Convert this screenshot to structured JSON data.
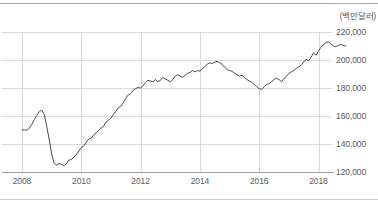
{
  "unit_label": "(백만달러)",
  "axis": {
    "y_ticks": [
      "220,000",
      "200,000",
      "180,000",
      "160,000",
      "140,000",
      "120,000"
    ],
    "x_ticks": [
      "2008",
      "2010",
      "2012",
      "2014",
      "2016",
      "2018"
    ]
  },
  "colors": {
    "line": "#4a4a4a",
    "grid": "#d6d8da",
    "axis": "#9a9da1",
    "text": "#58595b",
    "rule": "#a8abaf"
  },
  "chart_data": {
    "type": "line",
    "title": "",
    "subtitle": "",
    "xlabel": "",
    "ylabel": "(백만달러)",
    "unit": "백만달러",
    "xlim": [
      2008.0,
      2019.0
    ],
    "ylim": [
      120000,
      220000
    ],
    "y_tick_values": [
      220000,
      200000,
      180000,
      160000,
      140000,
      120000
    ],
    "x_tick_values": [
      2008,
      2010,
      2012,
      2014,
      2016,
      2018
    ],
    "grid": true,
    "legend": null,
    "series": [
      {
        "name": "수출액",
        "x": [
          2008.0,
          2008.08,
          2008.17,
          2008.25,
          2008.33,
          2008.42,
          2008.5,
          2008.58,
          2008.67,
          2008.75,
          2008.83,
          2008.92,
          2009.0,
          2009.08,
          2009.17,
          2009.25,
          2009.33,
          2009.42,
          2009.5,
          2009.58,
          2009.67,
          2009.75,
          2009.83,
          2009.92,
          2010.0,
          2010.08,
          2010.17,
          2010.25,
          2010.33,
          2010.42,
          2010.5,
          2010.58,
          2010.67,
          2010.75,
          2010.83,
          2010.92,
          2011.0,
          2011.08,
          2011.17,
          2011.25,
          2011.33,
          2011.42,
          2011.5,
          2011.58,
          2011.67,
          2011.75,
          2011.83,
          2011.92,
          2012.0,
          2012.08,
          2012.17,
          2012.25,
          2012.33,
          2012.42,
          2012.5,
          2012.58,
          2012.67,
          2012.75,
          2012.83,
          2012.92,
          2013.0,
          2013.08,
          2013.17,
          2013.25,
          2013.33,
          2013.42,
          2013.5,
          2013.58,
          2013.67,
          2013.75,
          2013.83,
          2013.92,
          2014.0,
          2014.08,
          2014.17,
          2014.25,
          2014.33,
          2014.42,
          2014.5,
          2014.58,
          2014.67,
          2014.75,
          2014.83,
          2014.92,
          2015.0,
          2015.08,
          2015.17,
          2015.25,
          2015.33,
          2015.42,
          2015.5,
          2015.58,
          2015.67,
          2015.75,
          2015.83,
          2015.92,
          2016.0,
          2016.08,
          2016.17,
          2016.25,
          2016.33,
          2016.42,
          2016.5,
          2016.58,
          2016.67,
          2016.75,
          2016.83,
          2016.92,
          2017.0,
          2017.08,
          2017.17,
          2017.25,
          2017.33,
          2017.42,
          2017.5,
          2017.58,
          2017.67,
          2017.75,
          2017.83,
          2017.92,
          2018.0,
          2018.08,
          2018.17,
          2018.25,
          2018.33,
          2018.42,
          2018.5,
          2018.58,
          2018.67,
          2018.75,
          2018.83,
          2018.92
        ],
        "values": [
          150000,
          150200,
          149800,
          151500,
          154000,
          157500,
          160500,
          163000,
          164200,
          161000,
          153000,
          143000,
          133000,
          126500,
          125000,
          126000,
          125500,
          124500,
          126000,
          128500,
          129000,
          130500,
          132500,
          135000,
          137500,
          138500,
          141500,
          143500,
          144000,
          146500,
          148000,
          149500,
          151500,
          152500,
          155500,
          157000,
          158500,
          161000,
          163500,
          166000,
          167000,
          169500,
          172500,
          175000,
          176000,
          178500,
          179500,
          180500,
          180000,
          181500,
          184000,
          185500,
          185000,
          184500,
          186000,
          184500,
          185500,
          187500,
          186500,
          185500,
          184500,
          186000,
          188500,
          189500,
          188500,
          187500,
          189000,
          190500,
          191000,
          192500,
          191500,
          192500,
          192000,
          193500,
          195500,
          197000,
          198000,
          197500,
          198500,
          199000,
          198000,
          197000,
          195000,
          193000,
          192500,
          192000,
          190500,
          189500,
          188500,
          189000,
          187500,
          186000,
          185000,
          184000,
          182500,
          181000,
          179500,
          179000,
          181000,
          182500,
          183000,
          184500,
          186000,
          187000,
          186000,
          184500,
          186500,
          188500,
          190500,
          191500,
          192500,
          194000,
          195000,
          196500,
          198500,
          200500,
          199500,
          202000,
          205000,
          203500,
          206500,
          209000,
          211000,
          212500,
          213000,
          211500,
          210000,
          209500,
          210500,
          211000,
          210500,
          210000
        ]
      }
    ]
  }
}
